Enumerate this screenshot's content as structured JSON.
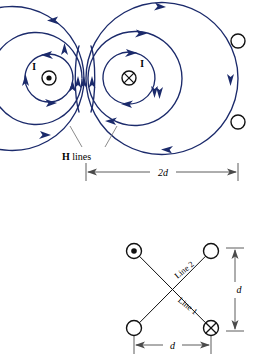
{
  "figure": {
    "colors": {
      "field_line": "#1b2a6b",
      "conductor_outline": "#111111",
      "dimension": "#4a4a4a",
      "background": "#ffffff"
    },
    "top_diagram": {
      "left_conductor": {
        "current_label": "I",
        "symbol": "current-out-of-page-dot",
        "cx": 49,
        "cy": 78,
        "r": 7
      },
      "right_conductor": {
        "current_label": "I",
        "symbol": "current-into-page-cross",
        "cx": 129,
        "cy": 78,
        "r": 7
      },
      "edge_conductors": [
        {
          "symbol": "plain-circle",
          "cx": 238,
          "cy": 41,
          "r": 7
        },
        {
          "symbol": "plain-circle",
          "cx": 238,
          "cy": 122,
          "r": 7
        }
      ],
      "field_label": {
        "prefix": "H",
        "suffix": " lines"
      },
      "dimension": {
        "label": "2d",
        "x_start": 86,
        "x_end": 238,
        "y": 172
      }
    },
    "bottom_diagram": {
      "nodes": [
        {
          "position": "top-left",
          "symbol": "current-out-of-page-dot",
          "cx": 134,
          "cy": 251,
          "r": 7.5
        },
        {
          "position": "top-right",
          "symbol": "plain-circle",
          "cx": 211,
          "cy": 251,
          "r": 7.5
        },
        {
          "position": "bottom-left",
          "symbol": "plain-circle",
          "cx": 134,
          "cy": 328,
          "r": 7.5
        },
        {
          "position": "bottom-right",
          "symbol": "current-into-page-cross",
          "cx": 211,
          "cy": 328,
          "r": 7.5
        }
      ],
      "lines": [
        {
          "name": "Line 1",
          "from": "top-left",
          "to": "bottom-right"
        },
        {
          "name": "Line 2",
          "from": "bottom-left",
          "to": "top-right"
        }
      ],
      "vertical_dimension": {
        "label": "d",
        "y_start": 248,
        "y_end": 331,
        "x": 235
      },
      "horizontal_dimension": {
        "label": "d",
        "x_start": 134,
        "x_end": 211,
        "y": 345
      }
    }
  }
}
